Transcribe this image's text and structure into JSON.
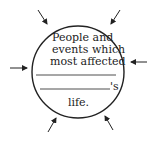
{
  "diagram": {
    "type": "circle-with-inward-arrows",
    "line1": "People and",
    "line2": "events which",
    "line3": "most affected",
    "blank_suffix": "'s",
    "last_line": "life.",
    "arrow_count": 6,
    "stroke_color": "#222222"
  }
}
